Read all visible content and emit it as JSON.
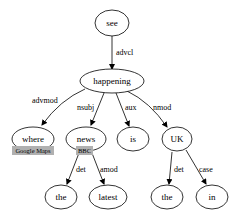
{
  "diagram": {
    "type": "dependency-parse-tree",
    "nodes": [
      {
        "id": "see",
        "label": "see"
      },
      {
        "id": "happening",
        "label": "happening"
      },
      {
        "id": "where",
        "label": "where",
        "tag": "Google Maps"
      },
      {
        "id": "news",
        "label": "news",
        "tag": "BBC"
      },
      {
        "id": "is",
        "label": "is"
      },
      {
        "id": "UK",
        "label": "UK"
      },
      {
        "id": "the1",
        "label": "the"
      },
      {
        "id": "latest",
        "label": "latest"
      },
      {
        "id": "the2",
        "label": "the"
      },
      {
        "id": "in",
        "label": "in"
      }
    ],
    "edges": [
      {
        "from": "see",
        "to": "happening",
        "label": "advcl"
      },
      {
        "from": "happening",
        "to": "where",
        "label": "advmod"
      },
      {
        "from": "happening",
        "to": "news",
        "label": "nsubj"
      },
      {
        "from": "happening",
        "to": "is",
        "label": "aux"
      },
      {
        "from": "happening",
        "to": "UK",
        "label": "nmod"
      },
      {
        "from": "news",
        "to": "the1",
        "label": "det"
      },
      {
        "from": "news",
        "to": "latest",
        "label": "amod"
      },
      {
        "from": "UK",
        "to": "the2",
        "label": "det"
      },
      {
        "from": "UK",
        "to": "in",
        "label": "case"
      }
    ],
    "colors": {
      "stroke": "#000000",
      "tag_background": "#b0b0b0",
      "background": "#ffffff"
    }
  }
}
